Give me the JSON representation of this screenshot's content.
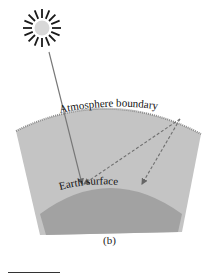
{
  "figure": {
    "caption": "(b)",
    "labels": {
      "atmosphere": "Atmosphere boundary",
      "earth": "Earth surface"
    },
    "icons": {
      "sun": "sun-icon"
    },
    "colors": {
      "atmosphere_fill": "#c4c4c4",
      "earth_fill": "#a2a2a2",
      "boundary_dots": "#8a8a8a",
      "ray": "#777777",
      "dashed_ray": "#6f6f6f",
      "sun_rays": "#1a1a1a",
      "sun_core": "#d8d8d8",
      "text": "#111111"
    }
  }
}
